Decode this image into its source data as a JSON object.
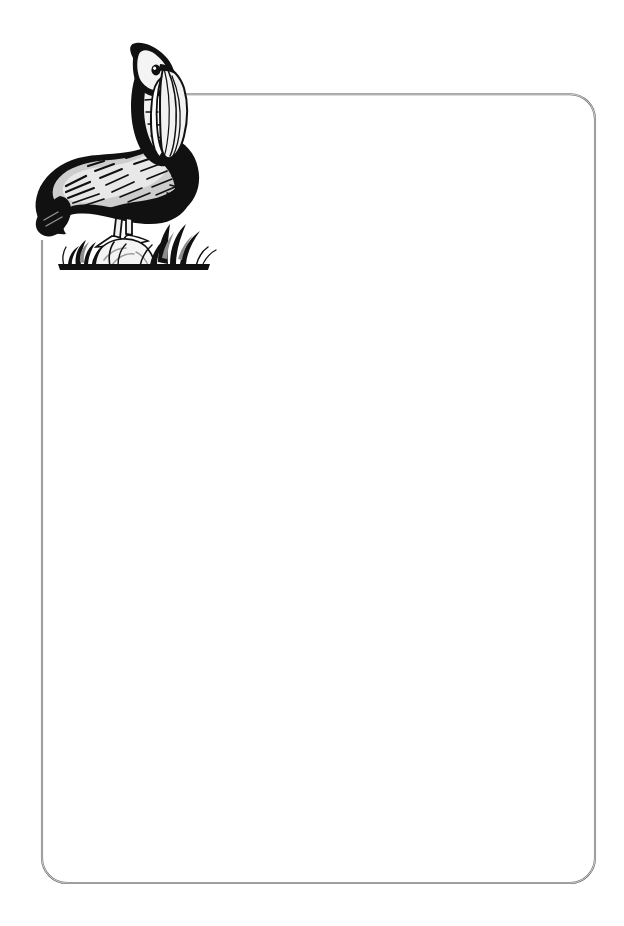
{
  "document": {
    "kind": "stationery-template",
    "title": "Pelican Letterhead",
    "page_width": 624,
    "page_height": 926,
    "background_color": "#ffffff",
    "body_text": ""
  },
  "frame": {
    "name": "rounded-border-frame",
    "stroke_color": "#8a8a8a",
    "stroke_highlight": "#d8d8d8",
    "stroke_width": 1,
    "corner_radius": 25,
    "left": 42,
    "top": 95,
    "right": 595,
    "bottom": 883,
    "top_line_start_x": 183,
    "left_line_start_y": 241,
    "open_corner": "top-left"
  },
  "illustration": {
    "name": "pelican-illustration",
    "subject": "pelican",
    "style": "woodcut-scratchboard",
    "alt_text": "Pelican perched on a grassy mound",
    "bounds": {
      "x": 36,
      "y": 43,
      "width": 174,
      "height": 222
    },
    "colors": {
      "ink": "#111111",
      "mid_gray": "#9b9b9b",
      "light_gray": "#c9c9c9",
      "pale_gray": "#e4e4e4",
      "paper": "#ffffff"
    },
    "parts": [
      {
        "name": "head",
        "label": "Head"
      },
      {
        "name": "eye",
        "label": "Eye"
      },
      {
        "name": "beak",
        "label": "Beak"
      },
      {
        "name": "pouch",
        "label": "Throat pouch"
      },
      {
        "name": "neck",
        "label": "Neck"
      },
      {
        "name": "body",
        "label": "Body"
      },
      {
        "name": "wing",
        "label": "Wing"
      },
      {
        "name": "tail",
        "label": "Tail"
      },
      {
        "name": "legs",
        "label": "Legs"
      },
      {
        "name": "feet",
        "label": "Feet"
      },
      {
        "name": "mound",
        "label": "Mound"
      },
      {
        "name": "grass",
        "label": "Grass tufts"
      },
      {
        "name": "reeds",
        "label": "Reeds"
      },
      {
        "name": "ground",
        "label": "Ground line"
      }
    ]
  }
}
